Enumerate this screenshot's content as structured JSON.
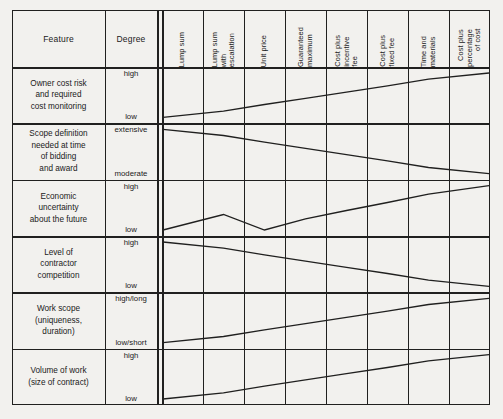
{
  "figure": {
    "background_color": "#f2f1ee",
    "line_color": "#20201f"
  },
  "header": {
    "feature_label": "Feature",
    "degree_label": "Degree"
  },
  "chart_data": {
    "type": "table",
    "title": "",
    "xlabel": "",
    "ylabel": "",
    "grid": true,
    "legend": "none",
    "categories": [
      "Lump sum",
      "Lump sum\nwith\nescalation",
      "Unit price",
      "Guaranteed\nmaximum",
      "Cost plus\nincentive\nfee",
      "Cost plus\nfixed fee",
      "Time and\nmaterials",
      "Cost plus\npercentage\nof cost"
    ],
    "column_count": 8,
    "series": [
      {
        "name": "Owner cost risk and required cost monitoring",
        "feature": "Owner cost risk\nand required\ncost monitoring",
        "degree_high": "high",
        "degree_low": "low",
        "trend": "increasing",
        "values": [
          0,
          14,
          29,
          43,
          57,
          71,
          86,
          100
        ]
      },
      {
        "name": "Scope definition needed at time of bidding and award",
        "feature": "Scope definition\nneeded at time\nof bidding\nand award",
        "degree_high": "extensive",
        "degree_low": "moderate",
        "trend": "decreasing",
        "values": [
          100,
          86,
          71,
          57,
          43,
          29,
          14,
          0
        ]
      },
      {
        "name": "Economic uncertainty about the future",
        "feature": "Economic\nuncertainty\nabout the future",
        "degree_high": "high",
        "degree_low": "low",
        "trend": "increasing-with-peak",
        "values": [
          0,
          35,
          0,
          25,
          44,
          62,
          81,
          100
        ]
      },
      {
        "name": "Level of contractor competition",
        "feature": "Level of\ncontractor\ncompetition",
        "degree_high": "high",
        "degree_low": "low",
        "trend": "decreasing",
        "values": [
          100,
          86,
          71,
          57,
          43,
          29,
          14,
          0
        ]
      },
      {
        "name": "Work scope (uniqueness, duration)",
        "feature": "Work scope\n(uniqueness,\nduration)",
        "degree_high": "high/long",
        "degree_low": "low/short",
        "trend": "increasing",
        "values": [
          0,
          14,
          29,
          43,
          57,
          71,
          86,
          100
        ]
      },
      {
        "name": "Volume of work (size of contract)",
        "feature": "Volume of work\n(size of contract)",
        "degree_high": "high",
        "degree_low": "low",
        "trend": "increasing",
        "values": [
          0,
          14,
          29,
          43,
          57,
          71,
          86,
          100
        ]
      }
    ]
  }
}
